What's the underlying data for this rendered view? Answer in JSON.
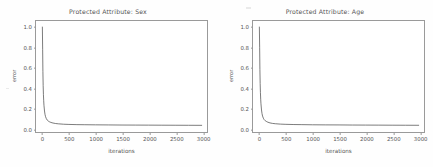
{
  "figure": {
    "background": "#fefefe",
    "axis_color": "#9a9a9a",
    "line_color": "#4d4d4d",
    "text_color": "#555555"
  },
  "chart_data": [
    {
      "type": "line",
      "title": "Protected Attribute: Sex",
      "xlabel": "iterations",
      "ylabel": "error",
      "xlim": [
        -120,
        3100
      ],
      "ylim": [
        -0.04,
        1.06
      ],
      "xticks": [
        0,
        500,
        1000,
        1500,
        2000,
        2500,
        3000
      ],
      "xticklabels": [
        "0",
        "500",
        "1000",
        "1500",
        "2000",
        "2500",
        "3000"
      ],
      "yticks": [
        0.0,
        0.2,
        0.4,
        0.6,
        0.8,
        1.0
      ],
      "yticklabels": [
        "0.0",
        "0.2",
        "0.4",
        "0.6",
        "0.8",
        "1.0"
      ],
      "grid": false,
      "legend": null,
      "series": [
        {
          "name": "error",
          "x": [
            0,
            5,
            10,
            15,
            20,
            25,
            30,
            40,
            50,
            60,
            75,
            90,
            110,
            130,
            160,
            200,
            250,
            300,
            400,
            500,
            650,
            800,
            1000,
            1250,
            1500,
            1750,
            2000,
            2250,
            2500,
            2750,
            3000
          ],
          "y": [
            1.0,
            0.78,
            0.56,
            0.42,
            0.33,
            0.27,
            0.225,
            0.168,
            0.134,
            0.112,
            0.092,
            0.079,
            0.069,
            0.062,
            0.055,
            0.049,
            0.044,
            0.041,
            0.037,
            0.035,
            0.033,
            0.032,
            0.031,
            0.03,
            0.029,
            0.0285,
            0.028,
            0.0275,
            0.027,
            0.0265,
            0.026
          ]
        }
      ]
    },
    {
      "type": "line",
      "title": "Protected Attribute: Age",
      "xlabel": "iterations",
      "ylabel": "error",
      "xlim": [
        -120,
        3100
      ],
      "ylim": [
        -0.04,
        1.06
      ],
      "xticks": [
        0,
        500,
        1000,
        1500,
        2000,
        2500,
        3000
      ],
      "xticklabels": [
        "0",
        "500",
        "1000",
        "1500",
        "2000",
        "2500",
        "3000"
      ],
      "yticks": [
        0.0,
        0.2,
        0.4,
        0.6,
        0.8,
        1.0
      ],
      "yticklabels": [
        "0.0",
        "0.2",
        "0.4",
        "0.6",
        "0.8",
        "1.0"
      ],
      "grid": false,
      "legend": null,
      "series": [
        {
          "name": "error",
          "x": [
            0,
            5,
            10,
            15,
            20,
            25,
            30,
            40,
            50,
            60,
            75,
            90,
            110,
            130,
            160,
            200,
            250,
            300,
            400,
            500,
            650,
            800,
            1000,
            1250,
            1500,
            1750,
            2000,
            2250,
            2500,
            2750,
            3000
          ],
          "y": [
            1.0,
            0.8,
            0.58,
            0.44,
            0.35,
            0.285,
            0.24,
            0.178,
            0.142,
            0.118,
            0.097,
            0.083,
            0.072,
            0.065,
            0.057,
            0.05,
            0.045,
            0.042,
            0.038,
            0.036,
            0.034,
            0.033,
            0.0315,
            0.0305,
            0.03,
            0.029,
            0.0285,
            0.028,
            0.0275,
            0.027,
            0.0265
          ]
        }
      ]
    }
  ]
}
